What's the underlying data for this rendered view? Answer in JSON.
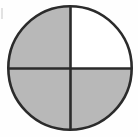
{
  "figure": {
    "shape": "circle",
    "background_color": "#fefefe",
    "outline_color": "#2b2b2b",
    "outline_width_px": 2.6,
    "divider_color": "#2b2b2b",
    "divider_width_px": 2.6,
    "shaded_color": "#b8b8b8",
    "unshaded_color": "#ffffff",
    "center_x": 70,
    "center_y": 68,
    "radius": 63,
    "artifact_label": "scan-speck"
  },
  "chart_data": {
    "type": "pie",
    "xlabel": "",
    "ylabel": "",
    "categories": [
      "top-left quadrant",
      "top-right quadrant",
      "bottom-right quadrant",
      "bottom-left quadrant"
    ],
    "values": [
      25,
      25,
      25,
      25
    ],
    "slice_fill": [
      "shaded",
      "unshaded",
      "shaded",
      "shaded"
    ],
    "slice_colors": [
      "#b8b8b8",
      "#ffffff",
      "#b8b8b8",
      "#b8b8b8"
    ],
    "shaded_count": 3,
    "total_parts": 4,
    "fraction_shaded": "3/4",
    "legend": [],
    "grid": false,
    "annotations": []
  },
  "quadrants": [
    {
      "name": "top-left",
      "start_angle_deg": 180,
      "end_angle_deg": 270,
      "fill": "#b8b8b8",
      "shaded": "true"
    },
    {
      "name": "top-right",
      "start_angle_deg": 270,
      "end_angle_deg": 360,
      "fill": "#ffffff",
      "shaded": "false"
    },
    {
      "name": "bottom-right",
      "start_angle_deg": 0,
      "end_angle_deg": 90,
      "fill": "#b8b8b8",
      "shaded": "true"
    },
    {
      "name": "bottom-left",
      "start_angle_deg": 90,
      "end_angle_deg": 180,
      "fill": "#b8b8b8",
      "shaded": "true"
    }
  ],
  "dividers": [
    {
      "name": "vertical-diameter",
      "x1": 70,
      "y1": 5,
      "x2": 70,
      "y2": 131
    },
    {
      "name": "horizontal-diameter",
      "x1": 7,
      "y1": 68,
      "x2": 133,
      "y2": 68
    }
  ]
}
